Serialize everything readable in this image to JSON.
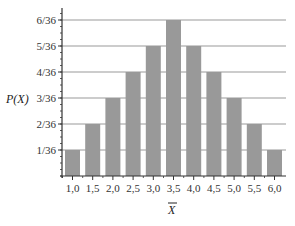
{
  "chart_data": {
    "type": "bar",
    "title": "",
    "xlabel": "X̄",
    "ylabel": "P(X)",
    "categories": [
      "1,0",
      "1,5",
      "2,0",
      "2,5",
      "3,0",
      "3,5",
      "4,0",
      "4,5",
      "5,0",
      "5,5",
      "6,0"
    ],
    "values": [
      1,
      2,
      3,
      4,
      5,
      6,
      5,
      4,
      3,
      2,
      1
    ],
    "value_denominator": 36,
    "yticks": [
      "1/36",
      "2/36",
      "3/36",
      "4/36",
      "5/36",
      "6/36"
    ],
    "ylim": [
      0,
      6.5
    ],
    "grid": true,
    "legend": null,
    "bar_color": "#999999",
    "gridline_color": "#999999",
    "axis_color": "#333333"
  }
}
